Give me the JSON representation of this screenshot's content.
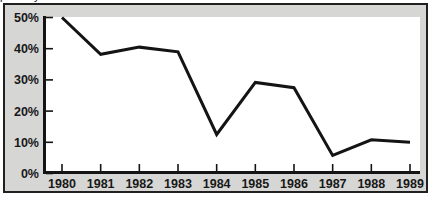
{
  "figure": {
    "clipped_text_above": "partially cut-off line of text above chart frame",
    "panel_background": "#d6d6d4",
    "panel_border_color": "#211f1f",
    "plot_background": "#ffffff"
  },
  "chart_data": {
    "type": "line",
    "title": "",
    "subtitle": "",
    "xlabel": "",
    "ylabel": "",
    "categories": [
      "1980",
      "1981",
      "1982",
      "1983",
      "1984",
      "1985",
      "1986",
      "1987",
      "1988",
      "1989"
    ],
    "values": [
      50,
      38.2,
      40.5,
      39,
      12.5,
      29.2,
      27.5,
      5.8,
      10.8,
      10
    ],
    "x_tick_labels": [
      "1980",
      "1981",
      "1982",
      "1983",
      "1984",
      "1985",
      "1986",
      "1987",
      "1988",
      "1989"
    ],
    "y_tick_labels": [
      "0%",
      "10%",
      "20%",
      "30%",
      "40%",
      "50%"
    ],
    "y_tick_values": [
      0,
      10,
      20,
      30,
      40,
      50
    ],
    "ylim": [
      0,
      50
    ],
    "grid": false,
    "legend": null,
    "series_color": "#141414",
    "series_line_width": 3,
    "annotations": []
  }
}
